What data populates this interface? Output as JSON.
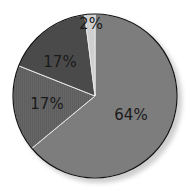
{
  "chart_data": {
    "type": "pie",
    "title": "",
    "start_angle_deg": 0,
    "direction": "clockwise",
    "slices": [
      {
        "label": "64%",
        "value": 64,
        "color": "#7d7d7d",
        "pattern": "none"
      },
      {
        "label": "17%",
        "value": 17,
        "color": "#666666",
        "pattern": "hatched"
      },
      {
        "label": "17%",
        "value": 17,
        "color": "#4a4a4a",
        "pattern": "none"
      },
      {
        "label": "2%",
        "value": 2,
        "color": "#cfcfcf",
        "pattern": "none"
      }
    ],
    "legend": "none",
    "shadow": true
  }
}
